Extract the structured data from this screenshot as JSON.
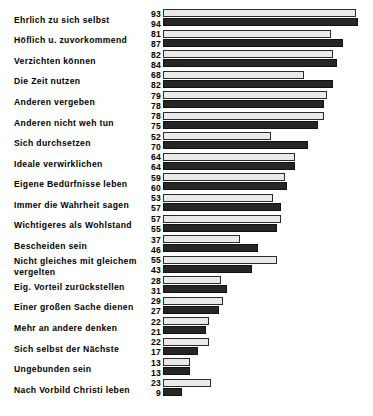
{
  "chart_data": {
    "type": "bar",
    "orientation": "horizontal",
    "title": "",
    "subtitle": "",
    "xlabel": "",
    "ylabel": "",
    "xlim": [
      0,
      100
    ],
    "grid": false,
    "legend": "none",
    "value_labels_position": "left-of-bars",
    "series": [
      {
        "name": "A",
        "style": "light",
        "color": "#e9e9e9",
        "values": [
          93,
          81,
          82,
          68,
          79,
          78,
          52,
          64,
          59,
          53,
          57,
          37,
          55,
          28,
          29,
          22,
          22,
          13,
          23
        ]
      },
      {
        "name": "B",
        "style": "dark",
        "color": "#262626",
        "values": [
          94,
          87,
          84,
          82,
          78,
          75,
          70,
          64,
          60,
          57,
          55,
          46,
          43,
          31,
          27,
          21,
          17,
          13,
          9
        ]
      }
    ],
    "categories": [
      "Ehrlich zu sich selbst",
      "Höflich u. zuvorkommend",
      "Verzichten können",
      "Die Zeit nutzen",
      "Anderen vergeben",
      "Anderen nicht weh tun",
      "Sich durchsetzen",
      "Ideale verwirklichen",
      "Eigene Bedürfnisse leben",
      "Immer die Wahrheit sagen",
      "Wichtigeres als Wohlstand",
      "Bescheiden sein",
      "Nicht gleiches mit gleichem vergelten",
      "Eig. Vorteil zurückstellen",
      "Einer großen Sache dienen",
      "Mehr an andere denken",
      "Sich selbst der Nächste",
      "Ungebunden sein",
      "Nach Vorbild Christi leben"
    ],
    "rows": [
      {
        "label_lines": [
          "Ehrlich zu sich selbst"
        ],
        "a": 93,
        "b": 94
      },
      {
        "label_lines": [
          "Höflich u. zuvorkommend"
        ],
        "a": 81,
        "b": 87
      },
      {
        "label_lines": [
          "Verzichten können"
        ],
        "a": 82,
        "b": 84
      },
      {
        "label_lines": [
          "Die Zeit nutzen"
        ],
        "a": 68,
        "b": 82
      },
      {
        "label_lines": [
          "Anderen vergeben"
        ],
        "a": 79,
        "b": 78
      },
      {
        "label_lines": [
          "Anderen nicht weh tun"
        ],
        "a": 78,
        "b": 75
      },
      {
        "label_lines": [
          "Sich durchsetzen"
        ],
        "a": 52,
        "b": 70
      },
      {
        "label_lines": [
          "Ideale verwirklichen"
        ],
        "a": 64,
        "b": 64
      },
      {
        "label_lines": [
          "Eigene Bedürfnisse leben"
        ],
        "a": 59,
        "b": 60
      },
      {
        "label_lines": [
          "Immer die Wahrheit sagen"
        ],
        "a": 53,
        "b": 57
      },
      {
        "label_lines": [
          "Wichtigeres als Wohlstand"
        ],
        "a": 57,
        "b": 55
      },
      {
        "label_lines": [
          "Bescheiden sein"
        ],
        "a": 37,
        "b": 46
      },
      {
        "label_lines": [
          "Nicht gleiches mit gleichem",
          "vergelten"
        ],
        "a": 55,
        "b": 43
      },
      {
        "label_lines": [
          "Eig. Vorteil zurückstellen"
        ],
        "a": 28,
        "b": 31
      },
      {
        "label_lines": [
          "Einer großen Sache dienen"
        ],
        "a": 29,
        "b": 27
      },
      {
        "label_lines": [
          "Mehr an andere denken"
        ],
        "a": 22,
        "b": 21
      },
      {
        "label_lines": [
          "Sich selbst der Nächste"
        ],
        "a": 22,
        "b": 17
      },
      {
        "label_lines": [
          "Ungebunden sein"
        ],
        "a": 13,
        "b": 13
      },
      {
        "label_lines": [
          "Nach Vorbild Christi leben"
        ],
        "a": 23,
        "b": 9
      }
    ]
  },
  "layout": {
    "row_top_start": 7,
    "row_pitch": 20.55,
    "px_per_unit": 2.07
  }
}
